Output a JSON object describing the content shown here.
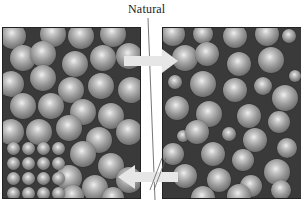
{
  "diagram": {
    "label_top": "Natural",
    "panels": [
      {
        "id": "left",
        "description": "Densely packed large spheres with ordered grid of small spheres in lower-left corner"
      },
      {
        "id": "right",
        "description": "Mixture of large and small spheres randomly packed"
      }
    ],
    "arrows": [
      {
        "direction": "right",
        "from": "left",
        "to": "right",
        "position": "top",
        "color": "#e6e6e6"
      },
      {
        "direction": "left",
        "from": "right",
        "to": "left",
        "position": "bottom",
        "color": "#e6e6e6",
        "crossed": true
      }
    ],
    "colors": {
      "background": "#ffffff",
      "panel_bg": "#3a3a3a",
      "sphere": "#9a9a9a",
      "arrow": "#e6e6e6",
      "line": "#555555"
    }
  }
}
